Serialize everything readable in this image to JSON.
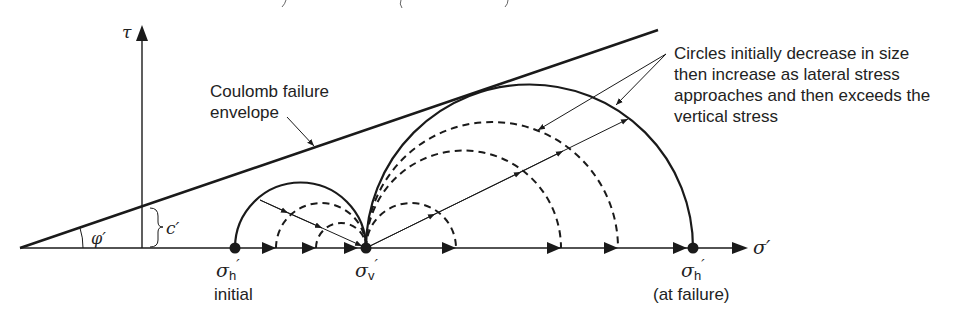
{
  "diagram": {
    "type": "mohr-circle-stress-path",
    "axes": {
      "x_label": "σ′",
      "y_label": "τ"
    },
    "envelope": {
      "label_line1": "Coulomb failure",
      "label_line2": "envelope",
      "friction_angle_label": "φ′",
      "cohesion_label": "c′"
    },
    "points": [
      {
        "id": "sigma_h_initial",
        "symbol": "σ",
        "subscript": "h",
        "prime": "′",
        "caption": "initial"
      },
      {
        "id": "sigma_v",
        "symbol": "σ",
        "subscript": "v",
        "prime": "′",
        "caption": ""
      },
      {
        "id": "sigma_h_failure",
        "symbol": "σ",
        "subscript": "h",
        "prime": "′",
        "caption": "(at failure)"
      }
    ],
    "annotation": {
      "line1": "Circles initially decrease in size",
      "line2": "then increase as lateral stress",
      "line3": "approaches and then exceeds the",
      "line4": "vertical stress"
    },
    "circles": [
      {
        "style": "solid",
        "left": "sigma_h_initial",
        "right": "sigma_v"
      },
      {
        "style": "dashed",
        "position": "left-of-sigma_v",
        "size": "medium"
      },
      {
        "style": "dashed",
        "position": "left-of-sigma_v",
        "size": "small"
      },
      {
        "style": "dashed",
        "position": "right-of-sigma_v",
        "size": "small"
      },
      {
        "style": "dashed",
        "position": "right-of-sigma_v",
        "size": "medium"
      },
      {
        "style": "dashed",
        "position": "right-of-sigma_v",
        "size": "large"
      },
      {
        "style": "solid",
        "left": "sigma_v",
        "right": "sigma_h_failure"
      }
    ],
    "colors": {
      "ink": "#1a1a1a",
      "background": "#ffffff"
    }
  }
}
